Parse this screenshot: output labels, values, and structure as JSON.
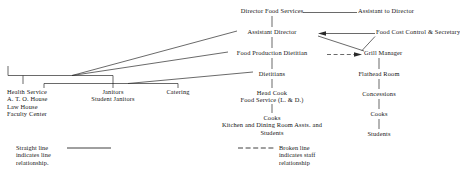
{
  "chart_title": "Food Services Organizational Chart",
  "nodes": {
    "director_food_services": "Director Food Services",
    "assistant_to_director": "Assistant to Director",
    "assistant_director": "Assistant Director",
    "food_cost_control": "Food Cost Control & Secretary",
    "food_production_dietitian": "Food Production Dietitian",
    "grill_manager": "Grill Manager",
    "dietitians": "Dietitians",
    "flathead_room": "Flathead Room",
    "head_cook_line1": "Head Cook",
    "head_cook_line2": "Food Service (L. & D.)",
    "concessions": "Concessions",
    "cooks_center": "Cooks",
    "kitchen_assts_line1": "Kitchen and Dining Room Assts. and",
    "kitchen_assts_line2": "Students",
    "cooks_right": "Cooks",
    "students_right": "Students",
    "health_service_line1": "Health Service",
    "health_service_line2": "A. T. O. House",
    "health_service_line3": "Law House",
    "health_service_line4": "Faculty Center",
    "janitors_line1": "Janitors",
    "janitors_line2": "Student Janitors",
    "catering": "Catering"
  },
  "legend": {
    "straight_line_1": "Straight line",
    "straight_line_2": "indicates line",
    "straight_line_3": "relationship.",
    "broken_line_1": "Broken line",
    "broken_line_2": "indicates staff",
    "broken_line_3": "relationship"
  },
  "colors": {
    "ink": "#151515",
    "line": "#2a2a2a",
    "background": "#ffffff"
  }
}
